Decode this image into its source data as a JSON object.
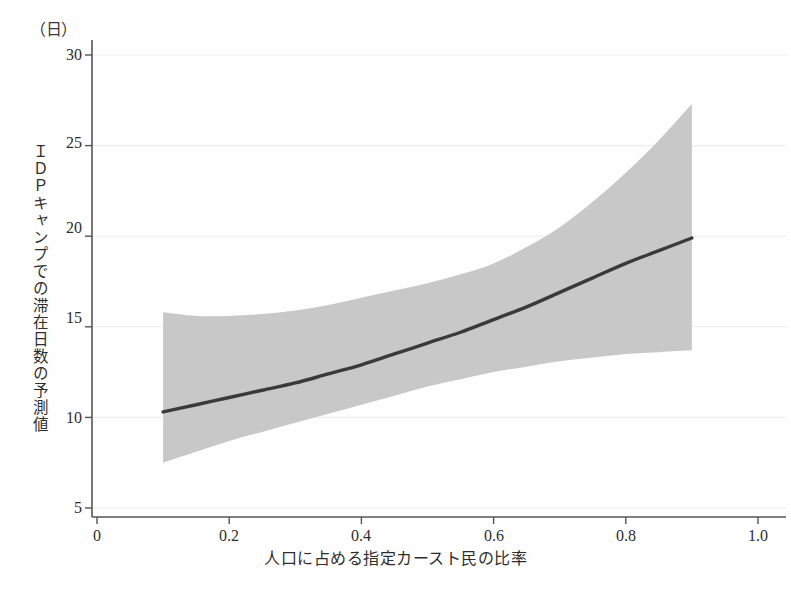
{
  "chart_data": {
    "type": "line",
    "title": "",
    "subtitle": "",
    "unit_label": "（日）",
    "xlabel": "人口に占める指定カースト民の比率",
    "ylabel": "ＩＤＰキャンプでの滞在日数の予測値",
    "xlim": [
      0,
      1.0
    ],
    "ylim": [
      5,
      30
    ],
    "grid": true,
    "grid_axis": "y",
    "legend": "none",
    "x_ticks": [
      0,
      0.2,
      0.4,
      0.6,
      0.8,
      1.0
    ],
    "x_tick_labels": [
      "0",
      "0.2",
      "0.4",
      "0.6",
      "0.8",
      "1.0"
    ],
    "y_ticks": [
      5,
      10,
      15,
      20,
      25,
      30
    ],
    "y_tick_labels": [
      "5",
      "10",
      "15",
      "20",
      "25",
      "30"
    ],
    "series": [
      {
        "name": "予測値",
        "kind": "line",
        "color": "#3a3a3a",
        "x": [
          0.1,
          0.15,
          0.2,
          0.25,
          0.3,
          0.35,
          0.4,
          0.45,
          0.5,
          0.55,
          0.6,
          0.65,
          0.7,
          0.75,
          0.8,
          0.85,
          0.9
        ],
        "values": [
          10.3,
          10.7,
          11.1,
          11.5,
          11.9,
          12.4,
          12.9,
          13.5,
          14.1,
          14.7,
          15.4,
          16.1,
          16.9,
          17.7,
          18.5,
          19.2,
          19.9
        ]
      },
      {
        "name": "信頼区間（上限）",
        "kind": "band-upper",
        "color": "#c8c8c8",
        "x": [
          0.1,
          0.15,
          0.2,
          0.25,
          0.3,
          0.35,
          0.4,
          0.45,
          0.5,
          0.55,
          0.6,
          0.65,
          0.7,
          0.75,
          0.8,
          0.85,
          0.9
        ],
        "values": [
          15.8,
          15.6,
          15.6,
          15.7,
          15.9,
          16.2,
          16.6,
          17.0,
          17.4,
          17.9,
          18.5,
          19.4,
          20.5,
          21.9,
          23.5,
          25.3,
          27.3
        ]
      },
      {
        "name": "信頼区間（下限）",
        "kind": "band-lower",
        "color": "#c8c8c8",
        "x": [
          0.1,
          0.15,
          0.2,
          0.25,
          0.3,
          0.35,
          0.4,
          0.45,
          0.5,
          0.55,
          0.6,
          0.65,
          0.7,
          0.75,
          0.8,
          0.85,
          0.9
        ],
        "values": [
          7.5,
          8.1,
          8.7,
          9.2,
          9.7,
          10.2,
          10.7,
          11.2,
          11.7,
          12.1,
          12.5,
          12.8,
          13.1,
          13.3,
          13.5,
          13.6,
          13.7
        ]
      }
    ],
    "colors": {
      "line": "#3a3a3a",
      "band": "#c8c8c8",
      "grid": "#ededed",
      "axis": "#555555",
      "text": "#2e2e2e",
      "background": "#ffffff"
    }
  }
}
